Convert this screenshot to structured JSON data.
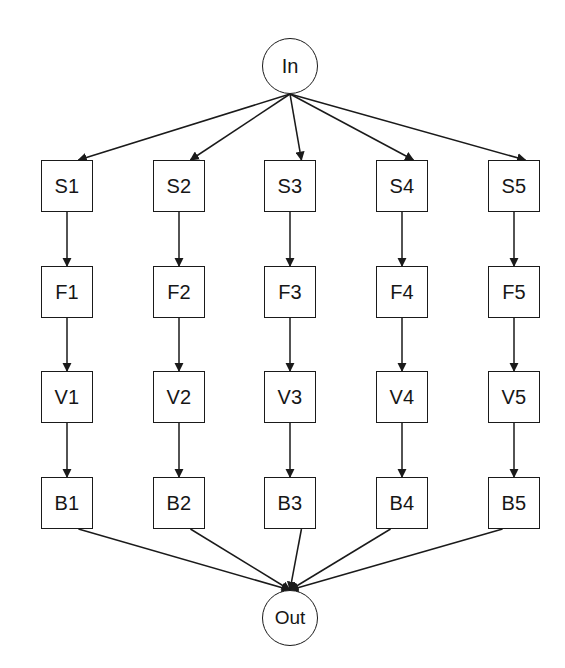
{
  "diagram": {
    "type": "flowchart",
    "canvas": {
      "width": 565,
      "height": 668,
      "background": "#ffffff"
    },
    "style": {
      "stroke": "#1a1a1a",
      "text": "#161616",
      "node_fill": "#ffffff",
      "stroke_width": 1.6
    },
    "entry": {
      "id": "In",
      "label": "In",
      "shape": "circle",
      "cx": 290,
      "cy": 66,
      "r": 28
    },
    "exit": {
      "id": "Out",
      "label": "Out",
      "shape": "circle",
      "cx": 290,
      "cy": 618,
      "r": 28
    },
    "columns": [
      {
        "index": 1,
        "x": 41
      },
      {
        "index": 2,
        "x": 153
      },
      {
        "index": 3,
        "x": 264
      },
      {
        "index": 4,
        "x": 376
      },
      {
        "index": 5,
        "x": 488
      }
    ],
    "rows": [
      {
        "prefix": "S",
        "y": 160
      },
      {
        "prefix": "F",
        "y": 266
      },
      {
        "prefix": "V",
        "y": 371
      },
      {
        "prefix": "B",
        "y": 477
      }
    ],
    "nodes": [
      {
        "id": "S1",
        "label": "S1",
        "row": "S",
        "col": 1,
        "x": 41,
        "y": 160
      },
      {
        "id": "S2",
        "label": "S2",
        "row": "S",
        "col": 2,
        "x": 153,
        "y": 160
      },
      {
        "id": "S3",
        "label": "S3",
        "row": "S",
        "col": 3,
        "x": 264,
        "y": 160
      },
      {
        "id": "S4",
        "label": "S4",
        "row": "S",
        "col": 4,
        "x": 376,
        "y": 160
      },
      {
        "id": "S5",
        "label": "S5",
        "row": "S",
        "col": 5,
        "x": 488,
        "y": 160
      },
      {
        "id": "F1",
        "label": "F1",
        "row": "F",
        "col": 1,
        "x": 41,
        "y": 266
      },
      {
        "id": "F2",
        "label": "F2",
        "row": "F",
        "col": 2,
        "x": 153,
        "y": 266
      },
      {
        "id": "F3",
        "label": "F3",
        "row": "F",
        "col": 3,
        "x": 264,
        "y": 266
      },
      {
        "id": "F4",
        "label": "F4",
        "row": "F",
        "col": 4,
        "x": 376,
        "y": 266
      },
      {
        "id": "F5",
        "label": "F5",
        "row": "F",
        "col": 5,
        "x": 488,
        "y": 266
      },
      {
        "id": "V1",
        "label": "V1",
        "row": "V",
        "col": 1,
        "x": 41,
        "y": 371
      },
      {
        "id": "V2",
        "label": "V2",
        "row": "V",
        "col": 2,
        "x": 153,
        "y": 371
      },
      {
        "id": "V3",
        "label": "V3",
        "row": "V",
        "col": 3,
        "x": 264,
        "y": 371
      },
      {
        "id": "V4",
        "label": "V4",
        "row": "V",
        "col": 4,
        "x": 376,
        "y": 371
      },
      {
        "id": "V5",
        "label": "V5",
        "row": "V",
        "col": 5,
        "x": 488,
        "y": 371
      },
      {
        "id": "B1",
        "label": "B1",
        "row": "B",
        "col": 1,
        "x": 41,
        "y": 477
      },
      {
        "id": "B2",
        "label": "B2",
        "row": "B",
        "col": 2,
        "x": 153,
        "y": 477
      },
      {
        "id": "B3",
        "label": "B3",
        "row": "B",
        "col": 3,
        "x": 264,
        "y": 477
      },
      {
        "id": "B4",
        "label": "B4",
        "row": "B",
        "col": 4,
        "x": 376,
        "y": 477
      },
      {
        "id": "B5",
        "label": "B5",
        "row": "B",
        "col": 5,
        "x": 488,
        "y": 477
      }
    ],
    "edges": [
      {
        "from": "In",
        "to": "S1",
        "kind": "fan-out"
      },
      {
        "from": "In",
        "to": "S2",
        "kind": "fan-out"
      },
      {
        "from": "In",
        "to": "S3",
        "kind": "fan-out"
      },
      {
        "from": "In",
        "to": "S4",
        "kind": "fan-out"
      },
      {
        "from": "In",
        "to": "S5",
        "kind": "fan-out"
      },
      {
        "from": "S1",
        "to": "F1",
        "kind": "vertical"
      },
      {
        "from": "S2",
        "to": "F2",
        "kind": "vertical"
      },
      {
        "from": "S3",
        "to": "F3",
        "kind": "vertical"
      },
      {
        "from": "S4",
        "to": "F4",
        "kind": "vertical"
      },
      {
        "from": "S5",
        "to": "F5",
        "kind": "vertical"
      },
      {
        "from": "F1",
        "to": "V1",
        "kind": "vertical"
      },
      {
        "from": "F2",
        "to": "V2",
        "kind": "vertical"
      },
      {
        "from": "F3",
        "to": "V3",
        "kind": "vertical"
      },
      {
        "from": "F4",
        "to": "V4",
        "kind": "vertical"
      },
      {
        "from": "F5",
        "to": "V5",
        "kind": "vertical"
      },
      {
        "from": "V1",
        "to": "B1",
        "kind": "vertical"
      },
      {
        "from": "V2",
        "to": "B2",
        "kind": "vertical"
      },
      {
        "from": "V3",
        "to": "B3",
        "kind": "vertical"
      },
      {
        "from": "V4",
        "to": "B4",
        "kind": "vertical"
      },
      {
        "from": "V5",
        "to": "B5",
        "kind": "vertical"
      },
      {
        "from": "B1",
        "to": "Out",
        "kind": "fan-in"
      },
      {
        "from": "B2",
        "to": "Out",
        "kind": "fan-in"
      },
      {
        "from": "B3",
        "to": "Out",
        "kind": "fan-in"
      },
      {
        "from": "B4",
        "to": "Out",
        "kind": "fan-in"
      },
      {
        "from": "B5",
        "to": "Out",
        "kind": "fan-in"
      }
    ]
  }
}
